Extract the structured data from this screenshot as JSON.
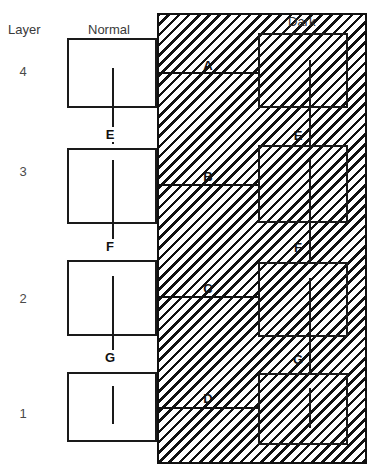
{
  "figure": {
    "width": 382,
    "height": 476,
    "type": "layered-structure-diagram"
  },
  "headers": {
    "layer_label": "Layer",
    "normal_label": "Normal",
    "dark_label": "Dark"
  },
  "layers": [
    {
      "number": "4",
      "y": 64
    },
    {
      "number": "3",
      "y": 164
    },
    {
      "number": "2",
      "y": 291
    },
    {
      "number": "1",
      "y": 406
    }
  ],
  "normal_boxes": [
    {
      "name": "normal-box-layer-4",
      "x": 67,
      "y": 38,
      "w": 90,
      "h": 70
    },
    {
      "name": "normal-box-layer-3",
      "x": 67,
      "y": 148,
      "w": 90,
      "h": 76
    },
    {
      "name": "normal-box-layer-2",
      "x": 67,
      "y": 260,
      "w": 90,
      "h": 76
    },
    {
      "name": "normal-box-layer-1",
      "x": 67,
      "y": 372,
      "w": 90,
      "h": 70
    }
  ],
  "dark_boxes": [
    {
      "name": "dark-box-layer-4",
      "x": 258,
      "y": 33,
      "w": 90,
      "h": 75
    },
    {
      "name": "dark-box-layer-3",
      "x": 258,
      "y": 145,
      "w": 90,
      "h": 78
    },
    {
      "name": "dark-box-layer-2",
      "x": 258,
      "y": 262,
      "w": 90,
      "h": 75
    },
    {
      "name": "dark-box-layer-1",
      "x": 258,
      "y": 373,
      "w": 90,
      "h": 72
    }
  ],
  "normal_connectors": [
    {
      "name": "normal-connector-4",
      "x": 112,
      "y": 68,
      "h": 76
    },
    {
      "name": "normal-connector-3",
      "x": 112,
      "y": 160,
      "h": 88
    },
    {
      "name": "normal-connector-2",
      "x": 112,
      "y": 276,
      "h": 84
    },
    {
      "name": "normal-connector-1",
      "x": 112,
      "y": 386,
      "h": 38
    }
  ],
  "dark_connectors": [
    {
      "name": "dark-connector-4",
      "x": 309,
      "y": 60,
      "h": 86
    },
    {
      "name": "dark-connector-3",
      "x": 309,
      "y": 160,
      "h": 104
    },
    {
      "name": "dark-connector-2",
      "x": 309,
      "y": 278,
      "h": 96
    },
    {
      "name": "dark-connector-1",
      "x": 309,
      "y": 388,
      "h": 40
    }
  ],
  "tie_lines": [
    {
      "name": "tie-line-a",
      "x": 157,
      "y": 72,
      "w": 101
    },
    {
      "name": "tie-line-b",
      "x": 157,
      "y": 184,
      "w": 101
    },
    {
      "name": "tie-line-c",
      "x": 157,
      "y": 296,
      "w": 101
    },
    {
      "name": "tie-line-d",
      "x": 157,
      "y": 407,
      "w": 101
    }
  ],
  "dark_region_tags": [
    {
      "name": "region-tag-a",
      "text": "A",
      "x": 202,
      "y": 58
    },
    {
      "name": "region-tag-b",
      "text": "B",
      "x": 202,
      "y": 169
    },
    {
      "name": "region-tag-c",
      "text": "C",
      "x": 202,
      "y": 281
    },
    {
      "name": "region-tag-d",
      "text": "D",
      "x": 202,
      "y": 391
    }
  ],
  "normal_junction_tags": [
    {
      "name": "junction-tag-e-normal",
      "text": "E",
      "x": 103,
      "y": 127
    },
    {
      "name": "junction-tag-f-normal",
      "text": "F",
      "x": 103,
      "y": 239
    },
    {
      "name": "junction-tag-g-normal",
      "text": "G",
      "x": 103,
      "y": 350
    }
  ],
  "dark_junction_tags": [
    {
      "name": "junction-tag-e-dark",
      "text": "E",
      "x": 292,
      "y": 128
    },
    {
      "name": "junction-tag-f-dark",
      "text": "F",
      "x": 292,
      "y": 240
    },
    {
      "name": "junction-tag-g-dark",
      "text": "G",
      "x": 292,
      "y": 352
    }
  ],
  "colors": {
    "stroke": "#111111",
    "background": "#ffffff",
    "text": "#3a3a3a"
  }
}
